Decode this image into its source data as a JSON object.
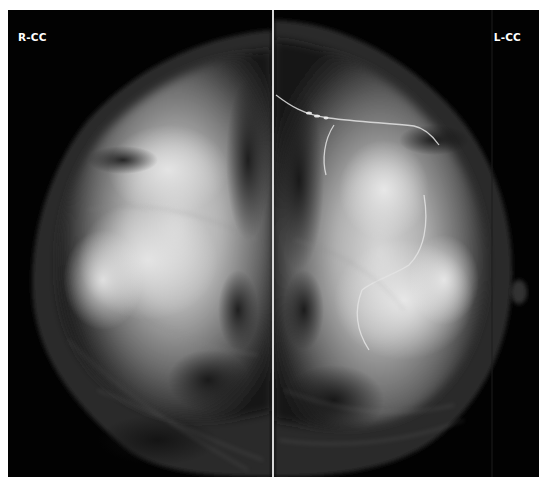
{
  "viewer": {
    "type": "mammography-bilateral-cc",
    "panels": [
      {
        "id": "right-cc",
        "label": "R-CC",
        "side": "left"
      },
      {
        "id": "left-cc",
        "label": "L-CC",
        "side": "right"
      }
    ],
    "colors": {
      "background": "#000000",
      "frame": "#ffffff",
      "divider": "#d8d8d8",
      "label": "#ffffff"
    }
  }
}
